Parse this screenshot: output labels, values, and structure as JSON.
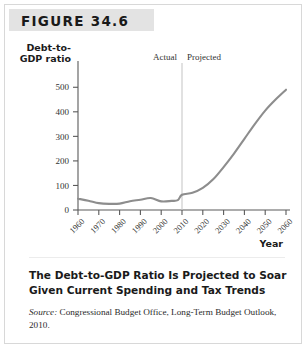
{
  "figure": {
    "number_label": "FIGURE 34.6",
    "caption_title": "The Debt-to-GDP Ratio Is Projected to Soar Given Current Spending and Tax Trends",
    "source_prefix": "Source:",
    "source_text": "Congressional Budget Office, Long-Term Budget Outlook, 2010."
  },
  "colors": {
    "header_band": "#e3e3e3",
    "line": "#8d8d8d",
    "axis": "#5a5a5a",
    "divider": "#c9c9c9",
    "text": "#1a1a1a"
  },
  "chart_data": {
    "type": "line",
    "title": "",
    "xlabel": "Year",
    "ylabel": "Debt-to-GDP ratio",
    "ylabel_line1": "Debt-to-",
    "ylabel_line2": "GDP ratio",
    "xlim": [
      1960,
      2060
    ],
    "ylim": [
      0,
      550
    ],
    "yticks": [
      0,
      100,
      200,
      300,
      400,
      500
    ],
    "ytick_labels": [
      "0",
      "100",
      "200",
      "300",
      "400",
      "500"
    ],
    "xticks": [
      1960,
      1970,
      1980,
      1990,
      2000,
      2010,
      2020,
      2030,
      2040,
      2050,
      2060
    ],
    "xtick_labels": [
      "1960",
      "1970",
      "1980",
      "1990",
      "2000",
      "2010",
      "2020",
      "2030",
      "2040",
      "2050",
      "2060"
    ],
    "grid": false,
    "legend": "none",
    "annotations": [
      {
        "name": "actual-label",
        "text": "Actual",
        "x": 1995
      },
      {
        "name": "projected-label",
        "text": "Projected",
        "x": 2025
      },
      {
        "name": "divider",
        "text": "",
        "x": 2010
      }
    ],
    "series": [
      {
        "name": "Debt-to-GDP ratio",
        "x": [
          1960,
          1965,
          1970,
          1975,
          1980,
          1985,
          1990,
          1995,
          2000,
          2005,
          2008,
          2010,
          2015,
          2020,
          2025,
          2030,
          2035,
          2040,
          2045,
          2050,
          2055,
          2060
        ],
        "values": [
          46,
          38,
          28,
          25,
          26,
          36,
          42,
          49,
          35,
          37,
          40,
          62,
          70,
          90,
          125,
          175,
          230,
          290,
          350,
          405,
          450,
          490
        ]
      }
    ]
  }
}
